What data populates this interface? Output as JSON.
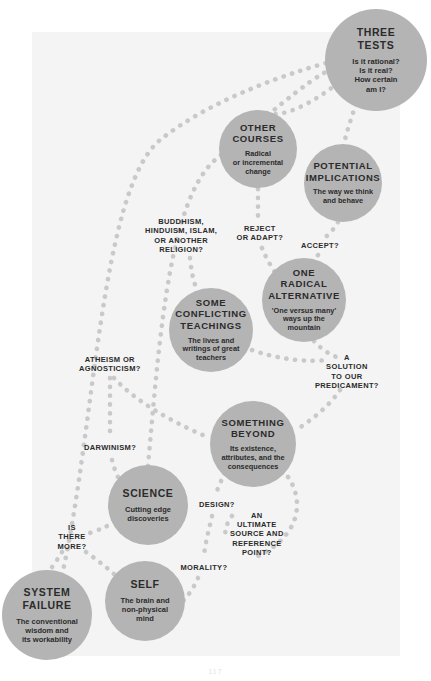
{
  "diagram": {
    "background_color": "#f4f4f4",
    "node_color": "#b4b4b4",
    "dot_color": "#c9c9c9",
    "text_color": "#2b2b2b",
    "page_number": "117"
  },
  "nodes": [
    {
      "id": "three-tests",
      "title": "THREE\nTESTS",
      "subtitle": "Is it rational?\nIs it real?\nHow certain\nam I?",
      "cx": 376,
      "cy": 60,
      "r": 51,
      "title_size": 10.5,
      "sub_size": 7.6
    },
    {
      "id": "other-courses",
      "title": "OTHER\nCOURSES",
      "subtitle": "Radical\nor incremental\nchange",
      "cx": 258,
      "cy": 149,
      "r": 39,
      "title_size": 9.5,
      "sub_size": 7.3
    },
    {
      "id": "potential-implications",
      "title": "POTENTIAL\nIMPLICATIONS",
      "subtitle": "The way we think\nand behave",
      "cx": 343,
      "cy": 183,
      "r": 39,
      "title_size": 9.5,
      "sub_size": 7.3
    },
    {
      "id": "one-radical-alternative",
      "title": "ONE\nRADICAL\nALTERNATIVE",
      "subtitle": "'One versus many'\nways up the\nmountain",
      "cx": 304,
      "cy": 300,
      "r": 42,
      "title_size": 9.5,
      "sub_size": 7.3
    },
    {
      "id": "some-conflicting-teachings",
      "title": "SOME\nCONFLICTING\nTEACHINGS",
      "subtitle": "The lives and\nwritings of great\nteachers",
      "cx": 211,
      "cy": 330,
      "r": 42,
      "title_size": 9.5,
      "sub_size": 7.3
    },
    {
      "id": "something-beyond",
      "title": "SOMETHING\nBEYOND",
      "subtitle": "Its existence,\nattributes, and the\nconsequences",
      "cx": 253,
      "cy": 444,
      "r": 43,
      "title_size": 9.5,
      "sub_size": 7.3
    },
    {
      "id": "science",
      "title": "SCIENCE",
      "subtitle": "Cutting edge\ndiscoveries",
      "cx": 148,
      "cy": 505,
      "r": 40,
      "title_size": 10.5,
      "sub_size": 7.5
    },
    {
      "id": "self",
      "title": "SELF",
      "subtitle": "The brain and\nnon-physical\nmind",
      "cx": 145,
      "cy": 601,
      "r": 40,
      "title_size": 10.5,
      "sub_size": 7.5
    },
    {
      "id": "system-failure",
      "title": "SYSTEM\nFAILURE",
      "subtitle": "The conventional\nwisdom and\nits workability",
      "cx": 47,
      "cy": 615,
      "r": 45,
      "title_size": 10.5,
      "sub_size": 7.5
    }
  ],
  "edge_labels": [
    {
      "id": "buddhism",
      "text": "BUDDHISM,\nHINDUISM, ISLAM,\nOR ANOTHER\nRELIGION?",
      "cx": 181,
      "cy": 236,
      "size": 7.5
    },
    {
      "id": "reject-or-adapt",
      "text": "REJECT\nOR ADAPT?",
      "cx": 260,
      "cy": 233,
      "size": 7.5
    },
    {
      "id": "accept",
      "text": "ACCEPT?",
      "cx": 320,
      "cy": 245,
      "size": 7.5
    },
    {
      "id": "a-solution",
      "text": "A\nSOLUTION\nTO OUR\nPREDICAMENT?",
      "cx": 347,
      "cy": 372,
      "size": 7.5
    },
    {
      "id": "atheism-or-agnosticism",
      "text": "ATHEISM OR\nAGNOSTICISM?",
      "cx": 110,
      "cy": 364,
      "size": 7.5
    },
    {
      "id": "darwinism",
      "text": "DARWINISM?",
      "cx": 110,
      "cy": 447,
      "size": 7.5
    },
    {
      "id": "design",
      "text": "DESIGN?",
      "cx": 217,
      "cy": 504,
      "size": 7.5
    },
    {
      "id": "an-ultimate-source",
      "text": "AN\nULTIMATE\nSOURCE AND\nREFERENCE\nPOINT?",
      "cx": 257,
      "cy": 534,
      "size": 7.5
    },
    {
      "id": "is-there-more",
      "text": "IS\nTHERE\nMORE?",
      "cx": 72,
      "cy": 537,
      "size": 7.5
    },
    {
      "id": "morality",
      "text": "MORALITY?",
      "cx": 204,
      "cy": 567,
      "size": 7.5
    }
  ],
  "paths": [
    {
      "id": "system-failure-to-three-tests",
      "d": "M 62 575 C 95 430 100 190 160 140 C 215 96 300 70 330 62"
    },
    {
      "id": "science-to-three-tests",
      "d": "M 148 466 C 160 330 170 200 215 160 C 262 120 310 78 330 70"
    },
    {
      "id": "other-courses-to-reject",
      "d": "M 258 189 L 258 218"
    },
    {
      "id": "reject-to-one-radical",
      "d": "M 262 248 C 266 258 272 268 278 277"
    },
    {
      "id": "three-tests-to-other-courses",
      "d": "M 338 83 C 310 105 282 118 267 113"
    },
    {
      "id": "three-tests-to-potential",
      "d": "M 356 104 C 350 122 346 134 344 144"
    },
    {
      "id": "potential-to-accept",
      "d": "M 338 222 C 332 232 326 238 322 238"
    },
    {
      "id": "accept-to-one-radical",
      "d": "M 318 255 C 316 262 314 266 312 260"
    },
    {
      "id": "one-radical-to-solution",
      "d": "M 314 341 C 322 350 332 356 340 358"
    },
    {
      "id": "solution-to-something-beyond",
      "d": "M 340 390 C 330 405 312 420 296 430"
    },
    {
      "id": "conflicting-to-solution",
      "d": "M 252 350 C 280 360 308 362 328 360"
    },
    {
      "id": "buddhism-to-conflicting",
      "d": "M 190 258 C 192 278 196 292 200 290"
    },
    {
      "id": "atheism-to-darwinism",
      "d": "M 110 378 L 110 434"
    },
    {
      "id": "atheism-to-something-beyond",
      "d": "M 114 378 C 140 406 185 428 210 438"
    },
    {
      "id": "darwinism-to-science",
      "d": "M 112 460 C 116 476 122 486 128 490"
    },
    {
      "id": "science-to-is-there-more",
      "d": "M 115 522 C 104 528 94 532 86 534"
    },
    {
      "id": "is-there-more-to-system-failure",
      "d": "M 62 552 C 56 562 50 570 48 572"
    },
    {
      "id": "is-there-more-to-self",
      "d": "M 86 552 C 100 562 110 570 116 576"
    },
    {
      "id": "something-beyond-to-design",
      "d": "M 225 473 C 220 483 217 490 216 494"
    },
    {
      "id": "design-to-morality",
      "d": "M 212 516 C 208 534 204 548 204 558"
    },
    {
      "id": "morality-to-self",
      "d": "M 198 578 C 192 592 184 600 180 604"
    },
    {
      "id": "something-beyond-to-ultimate",
      "d": "M 288 477 C 300 494 300 516 288 532 C 278 546 266 552 258 556"
    },
    {
      "id": "ultimate-left-edge",
      "d": "M 232 516 C 226 524 224 532 226 540"
    }
  ]
}
